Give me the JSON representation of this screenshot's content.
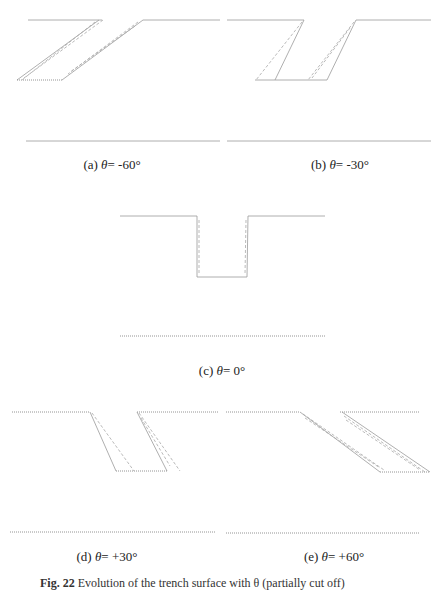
{
  "figure": {
    "caption_number": "Fig. 22",
    "caption_text": "Evolution of the trench surface with θ (partially cut off)",
    "panels": [
      {
        "id": "a",
        "tag": "(a)",
        "symbol": "θ",
        "eq": "= -60°",
        "angle_deg": -60
      },
      {
        "id": "b",
        "tag": "(b)",
        "symbol": "θ",
        "eq": "= -30°",
        "angle_deg": -30
      },
      {
        "id": "c",
        "tag": "(c)",
        "symbol": "θ",
        "eq": "= 0°",
        "angle_deg": 0
      },
      {
        "id": "d",
        "tag": "(d)",
        "symbol": "θ",
        "eq": "= +30°",
        "angle_deg": 30
      },
      {
        "id": "e",
        "tag": "(e)",
        "symbol": "θ",
        "eq": "= +60°",
        "angle_deg": 60
      }
    ]
  },
  "colors": {
    "line": "#9a9a9a",
    "text": "#222222"
  }
}
